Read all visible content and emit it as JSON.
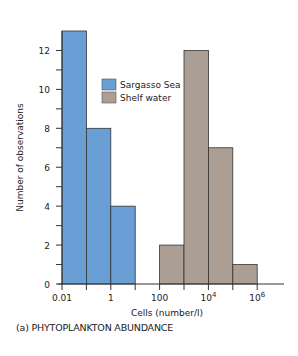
{
  "chart_data": {
    "type": "bar",
    "subtype": "histogram",
    "title": "",
    "caption": "(a) PHYTOPLANKTON ABUNDANCE",
    "xlabel": "Cells (number/l)",
    "ylabel": "Number of observations",
    "x_scale": "log10",
    "xlim_log10": [
      -2,
      6.7
    ],
    "ylim": [
      0,
      13
    ],
    "y_major_ticks": [
      0,
      2,
      4,
      6,
      8,
      10,
      12
    ],
    "y_minor_ticks": [
      1,
      3,
      5,
      7,
      9,
      11
    ],
    "x_tick_labels": [
      {
        "log10": -2,
        "text": "0.01"
      },
      {
        "log10": 0,
        "text": "1"
      },
      {
        "log10": 2,
        "text": "100"
      },
      {
        "log10": 4,
        "text": "10",
        "sup": "4"
      },
      {
        "log10": 6,
        "text": "10",
        "sup": "6"
      }
    ],
    "x_minor_ticks_log10": [
      -1,
      1,
      3,
      5
    ],
    "grid": false,
    "legend_position": "top-center",
    "series": [
      {
        "name": "Sargasso Sea",
        "color": "#6a9fd6",
        "bins": [
          {
            "from_log10": -2,
            "to_log10": -1,
            "value": 13
          },
          {
            "from_log10": -1,
            "to_log10": 0,
            "value": 8
          },
          {
            "from_log10": 0,
            "to_log10": 1,
            "value": 4
          }
        ]
      },
      {
        "name": "Shelf water",
        "color": "#ab9e95",
        "bins": [
          {
            "from_log10": 2,
            "to_log10": 3,
            "value": 2
          },
          {
            "from_log10": 3,
            "to_log10": 4,
            "value": 12
          },
          {
            "from_log10": 4,
            "to_log10": 5,
            "value": 7
          },
          {
            "from_log10": 5,
            "to_log10": 6,
            "value": 1
          }
        ]
      }
    ]
  }
}
